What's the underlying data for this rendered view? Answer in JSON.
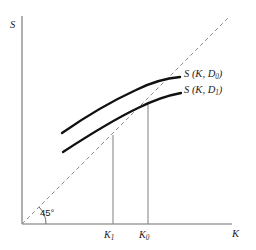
{
  "figure": {
    "type": "economics-diagram",
    "background_color": "#ffffff"
  },
  "axes": {
    "y_label": "S",
    "x_label": "K",
    "axis_color": "#6e6e6e",
    "origin": {
      "x": 22,
      "y": 224
    },
    "y_top": {
      "x": 22,
      "y": 16
    },
    "x_right": {
      "x": 232,
      "y": 224
    }
  },
  "reference_line": {
    "name": "45-degree-line",
    "label": "45°",
    "style": "dashed",
    "color": "#8c8c8c",
    "from": {
      "x": 22,
      "y": 224
    },
    "to": {
      "x": 230,
      "y": 16
    }
  },
  "ticks": [
    {
      "label": "K",
      "subscript": "1",
      "x": 113
    },
    {
      "label": "K",
      "subscript": "0",
      "x": 148
    }
  ],
  "drop_lines": [
    {
      "name": "drop-line-k1",
      "x": 113,
      "y_top": 135,
      "y_bottom": 224,
      "color": "#8a8a8a"
    },
    {
      "name": "drop-line-k0",
      "x": 148,
      "y_top": 104,
      "y_bottom": 224,
      "color": "#8a8a8a"
    }
  ],
  "curves": [
    {
      "name": "supply-curve-d0",
      "label_prefix": "S (K,",
      "label_sub": "0",
      "label_suffix": "D",
      "label_text": "S (K, D",
      "label_close": ")",
      "color": "#111111",
      "width": 2.3,
      "path": "M 62 133 C 85 117, 112 101, 136 90 C 152 82, 168 78, 180 77"
    },
    {
      "name": "supply-curve-d1",
      "label_text": "S (K, D",
      "label_sub": "1",
      "label_close": ")",
      "color": "#111111",
      "width": 2.3,
      "path": "M 63 152 C 86 137, 113 120, 138 108 C 154 100, 170 95, 181 93"
    }
  ],
  "curve_labels": {
    "d0": {
      "prefix": "S (K, D",
      "sub": "0",
      "suffix": ")"
    },
    "d1": {
      "prefix": "S (K, D",
      "sub": "1",
      "suffix": ")"
    }
  },
  "chart_data": {
    "type": "line",
    "title": "",
    "xlabel": "K",
    "ylabel": "S",
    "grid": false,
    "legend_position": "right-inline",
    "annotations": [
      "45°"
    ],
    "series": [
      {
        "name": "S (K, D0)",
        "x": [
          62,
          86,
          110,
          136,
          160,
          180
        ],
        "y": [
          133,
          117,
          102,
          90,
          81,
          77
        ]
      },
      {
        "name": "S (K, D1)",
        "x": [
          63,
          87,
          112,
          138,
          162,
          181
        ],
        "y": [
          152,
          136,
          120,
          108,
          98,
          93
        ]
      },
      {
        "name": "45-degree line",
        "x": [
          22,
          230
        ],
        "y": [
          224,
          16
        ]
      }
    ],
    "markers": [
      {
        "name": "K1",
        "x": 113,
        "y": 135
      },
      {
        "name": "K0",
        "x": 148,
        "y": 104
      }
    ]
  }
}
